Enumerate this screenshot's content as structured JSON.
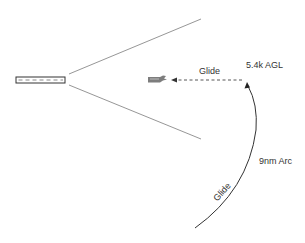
{
  "diagram": {
    "type": "approach-glide-diagram",
    "colors": {
      "line": "#8a8a8a",
      "arc": "#333333",
      "text": "#333333",
      "runway_border": "#333333",
      "runway_dash": "#888888",
      "aircraft": "#666666"
    },
    "runway": {
      "icon": "runway-rectangle"
    },
    "cone": {
      "description": "approach funnel lines"
    },
    "aircraft": {
      "icon": "airplane-icon"
    },
    "labels": {
      "glide_path": "Glide",
      "altitude": "5.4k AGL",
      "arc_distance": "9nm Arc",
      "arc_glide": "Glide"
    }
  }
}
